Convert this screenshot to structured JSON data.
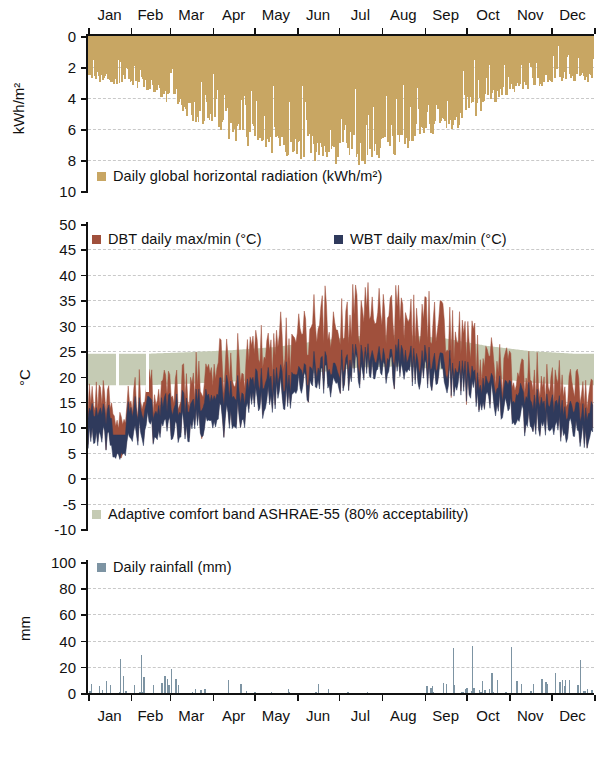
{
  "figure": {
    "months": [
      "Jan",
      "Feb",
      "Mar",
      "Apr",
      "May",
      "Jun",
      "Jul",
      "Aug",
      "Sep",
      "Oct",
      "Nov",
      "Dec"
    ],
    "colors": {
      "radiation": "#c8a663",
      "dbt": "#a0503c",
      "wbt": "#2f3a5c",
      "comfort_band": "#c5cbb4",
      "rainfall": "#7d94a3",
      "axis": "#111111",
      "grid": "#c9c9c9",
      "background": "#ffffff"
    }
  },
  "panels": {
    "radiation": {
      "ylabel": "kWh/m²",
      "yticks": [
        "0",
        "2",
        "4",
        "6",
        "8",
        "10"
      ],
      "ylim": [
        0,
        10
      ],
      "inverted": true,
      "legend": [
        {
          "label": "Daily global horizontal radiation (kWh/m²)",
          "color_key": "radiation",
          "icon": "legend-swatch-icon"
        }
      ]
    },
    "temperature": {
      "ylabel": "°C",
      "yticks": [
        "50",
        "45",
        "40",
        "35",
        "30",
        "25",
        "20",
        "15",
        "10",
        "5",
        "0",
        "-5",
        "-10"
      ],
      "ylim": [
        -10,
        50
      ],
      "legend_top": [
        {
          "label": "DBT daily max/min (°C)",
          "color_key": "dbt",
          "icon": "legend-swatch-icon"
        },
        {
          "label": "WBT daily max/min (°C)",
          "color_key": "wbt",
          "icon": "legend-swatch-icon"
        }
      ],
      "legend_bottom": [
        {
          "label": "Adaptive comfort band ASHRAE-55 (80% acceptability)",
          "color_key": "comfort_band",
          "icon": "legend-swatch-icon"
        }
      ]
    },
    "rainfall": {
      "ylabel": "mm",
      "yticks": [
        "100",
        "80",
        "60",
        "40",
        "20",
        "0"
      ],
      "ylim": [
        0,
        100
      ],
      "legend": [
        {
          "label": "Daily rainfall (mm)",
          "color_key": "rainfall",
          "icon": "legend-swatch-icon"
        }
      ]
    }
  },
  "chart_data": [
    {
      "type": "area",
      "id": "daily-global-horizontal-radiation",
      "title": "Daily global horizontal radiation (kWh/m²)",
      "xlabel": "",
      "ylabel": "kWh/m²",
      "ylim": [
        0,
        10
      ],
      "y_inverted": true,
      "grid": true,
      "units": "kWh/m2",
      "x": "day of year 1-365",
      "month_means": {
        "Jan": 2.4,
        "Feb": 2.8,
        "Mar": 4.2,
        "Apr": 5.4,
        "May": 6.4,
        "Jun": 6.9,
        "Jul": 6.8,
        "Aug": 6.2,
        "Sep": 5.0,
        "Oct": 3.6,
        "Nov": 2.6,
        "Dec": 2.2
      },
      "month_max": {
        "Jan": 3.1,
        "Feb": 3.6,
        "Mar": 5.6,
        "Apr": 6.9,
        "May": 7.8,
        "Jun": 8.2,
        "Jul": 8.5,
        "Aug": 7.6,
        "Sep": 6.4,
        "Oct": 4.8,
        "Nov": 3.4,
        "Dec": 3.0
      },
      "month_min": {
        "Jan": 0.6,
        "Feb": 0.9,
        "Mar": 1.2,
        "Apr": 1.6,
        "May": 2.2,
        "Jun": 2.5,
        "Jul": 2.6,
        "Aug": 2.2,
        "Sep": 1.6,
        "Oct": 1.1,
        "Nov": 0.7,
        "Dec": 0.6
      },
      "annual_peak": 8.6,
      "note": "Values plotted downward from 0 at top of panel"
    },
    {
      "type": "area",
      "id": "dbt-wbt-daily-max-min",
      "title": "DBT / WBT daily max/min (°C) with adaptive comfort band",
      "xlabel": "",
      "ylabel": "°C",
      "ylim": [
        -10,
        50
      ],
      "grid": true,
      "series": [
        {
          "name": "DBT daily max/min (°C)",
          "color_key": "dbt",
          "month_max": {
            "Jan": 16,
            "Feb": 17,
            "Mar": 19,
            "Apr": 22,
            "May": 25,
            "Jun": 31,
            "Jul": 33,
            "Aug": 32,
            "Sep": 29,
            "Oct": 24,
            "Nov": 20,
            "Dec": 17
          },
          "month_min": {
            "Jan": 9,
            "Feb": 10,
            "Mar": 11,
            "Apr": 13,
            "May": 16,
            "Jun": 20,
            "Jul": 22,
            "Aug": 22,
            "Sep": 20,
            "Oct": 16,
            "Nov": 12,
            "Dec": 9
          },
          "annual_max": 38.5,
          "annual_min": 3.8
        },
        {
          "name": "WBT daily max/min (°C)",
          "color_key": "wbt",
          "month_max": {
            "Jan": 13,
            "Feb": 14,
            "Mar": 15,
            "Apr": 17,
            "May": 19,
            "Jun": 22,
            "Jul": 24,
            "Aug": 24,
            "Sep": 22,
            "Oct": 19,
            "Nov": 16,
            "Dec": 13
          },
          "month_min": {
            "Jan": 7,
            "Feb": 8,
            "Mar": 9,
            "Apr": 11,
            "May": 14,
            "Jun": 18,
            "Jul": 20,
            "Aug": 20,
            "Sep": 18,
            "Oct": 14,
            "Nov": 10,
            "Dec": 7
          },
          "annual_max": 25.5,
          "annual_min": 3.6
        },
        {
          "name": "Adaptive comfort band ASHRAE-55 (80% acceptability)",
          "color_key": "comfort_band",
          "band_upper": {
            "Jan": 24.5,
            "Feb": 24.5,
            "Mar": 24.8,
            "Apr": 25.2,
            "May": 25.8,
            "Jun": 27.0,
            "Jul": 28.0,
            "Aug": 28.2,
            "Sep": 27.5,
            "Oct": 26.0,
            "Nov": 25.0,
            "Dec": 24.5
          },
          "band_lower": {
            "Jan": 18.3,
            "Feb": 18.3,
            "Mar": 18.6,
            "Apr": 19.0,
            "May": 19.6,
            "Jun": 20.8,
            "Jul": 21.8,
            "Aug": 22.0,
            "Sep": 21.3,
            "Oct": 19.8,
            "Nov": 18.8,
            "Dec": 18.3
          }
        }
      ]
    },
    {
      "type": "bar",
      "id": "daily-rainfall",
      "title": "Daily rainfall (mm)",
      "xlabel": "",
      "ylabel": "mm",
      "ylim": [
        0,
        100
      ],
      "grid": true,
      "units": "mm",
      "notable_events": [
        {
          "month": "Jan",
          "day_of_month": 3,
          "value": 7
        },
        {
          "month": "Jan",
          "day_of_month": 9,
          "value": 5
        },
        {
          "month": "Jan",
          "day_of_month": 14,
          "value": 9
        },
        {
          "month": "Jan",
          "day_of_month": 17,
          "value": 6
        },
        {
          "month": "Jan",
          "day_of_month": 24,
          "value": 26
        },
        {
          "month": "Jan",
          "day_of_month": 26,
          "value": 13
        },
        {
          "month": "Feb",
          "day_of_month": 8,
          "value": 29
        },
        {
          "month": "Feb",
          "day_of_month": 10,
          "value": 12
        },
        {
          "month": "Feb",
          "day_of_month": 25,
          "value": 13
        },
        {
          "month": "Mar",
          "day_of_month": 2,
          "value": 18
        },
        {
          "month": "Mar",
          "day_of_month": 5,
          "value": 11
        },
        {
          "month": "Mar",
          "day_of_month": 7,
          "value": 6
        },
        {
          "month": "Apr",
          "day_of_month": 12,
          "value": 10
        },
        {
          "month": "Apr",
          "day_of_month": 21,
          "value": 7
        },
        {
          "month": "Jun",
          "day_of_month": 16,
          "value": 7
        },
        {
          "month": "Sep",
          "day_of_month": 2,
          "value": 5
        },
        {
          "month": "Sep",
          "day_of_month": 14,
          "value": 8
        },
        {
          "month": "Sep",
          "day_of_month": 21,
          "value": 34
        },
        {
          "month": "Oct",
          "day_of_month": 5,
          "value": 36
        },
        {
          "month": "Oct",
          "day_of_month": 12,
          "value": 9
        },
        {
          "month": "Oct",
          "day_of_month": 19,
          "value": 15
        },
        {
          "month": "Nov",
          "day_of_month": 2,
          "value": 35
        },
        {
          "month": "Nov",
          "day_of_month": 6,
          "value": 9
        },
        {
          "month": "Nov",
          "day_of_month": 9,
          "value": 7
        },
        {
          "month": "Nov",
          "day_of_month": 24,
          "value": 11
        },
        {
          "month": "Dec",
          "day_of_month": 4,
          "value": 15
        },
        {
          "month": "Dec",
          "day_of_month": 9,
          "value": 10
        },
        {
          "month": "Dec",
          "day_of_month": 22,
          "value": 25
        }
      ],
      "annual_peak": 36
    }
  ]
}
